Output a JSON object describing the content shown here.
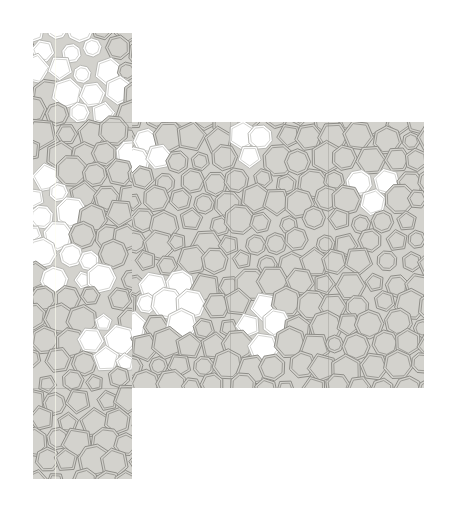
{
  "image": {
    "subject": "tile-mosaic",
    "colors": {
      "background": "#ffffff",
      "tile_fill": "#d3d2cd",
      "tile_line": "#8e8d88",
      "highlight_fill": "#ffffff"
    },
    "panels": [
      {
        "name": "left-strip",
        "x": 33,
        "y": 33,
        "width": 99,
        "height": 446
      },
      {
        "name": "right-panel",
        "x": 132,
        "y": 122,
        "width": 292,
        "height": 266
      }
    ],
    "seams": [
      {
        "orientation": "vertical",
        "x": 230,
        "y": 122,
        "length": 266
      },
      {
        "orientation": "vertical",
        "x": 328,
        "y": 122,
        "length": 266
      },
      {
        "orientation": "horizontal",
        "x": 33,
        "y": 122,
        "length": 99
      },
      {
        "orientation": "horizontal",
        "x": 33,
        "y": 388,
        "length": 99
      }
    ]
  }
}
